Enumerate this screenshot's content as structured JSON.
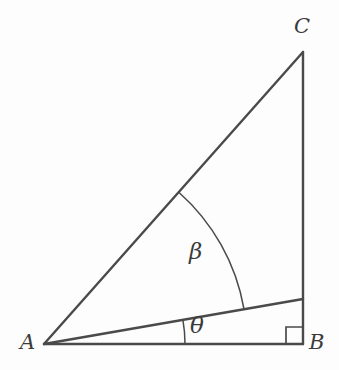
{
  "figure": {
    "type": "geometry-diagram",
    "background_color": "#fdfdfd",
    "stroke_color": "#4a4a4a",
    "label_color": "#3b3b3b",
    "points": {
      "A": {
        "label": "A",
        "x": 44,
        "y": 344
      },
      "B": {
        "label": "B",
        "x": 303,
        "y": 344
      },
      "C": {
        "label": "C",
        "x": 303,
        "y": 52
      },
      "D": {
        "label": "",
        "x": 303,
        "y": 299
      }
    },
    "segments": [
      {
        "name": "side-AB",
        "from": "A",
        "to": "B"
      },
      {
        "name": "side-BC",
        "from": "B",
        "to": "C"
      },
      {
        "name": "side-AC",
        "from": "A",
        "to": "C"
      },
      {
        "name": "ray-AD",
        "from": "A",
        "to": "D"
      }
    ],
    "angles": [
      {
        "name": "angle-beta",
        "label": "β",
        "vertex": "A",
        "between": [
          "ray-AD",
          "side-AC"
        ],
        "arc_radius": 203,
        "start_deg": 48.4,
        "end_deg": 10.0
      },
      {
        "name": "angle-theta",
        "label": "θ",
        "vertex": "A",
        "between": [
          "side-AB",
          "ray-AD"
        ],
        "arc_radius": 141,
        "start_deg": 10.0,
        "end_deg": 0.0
      }
    ],
    "right_angle": {
      "name": "right-angle-marker",
      "vertex": "B",
      "size": 17
    }
  }
}
